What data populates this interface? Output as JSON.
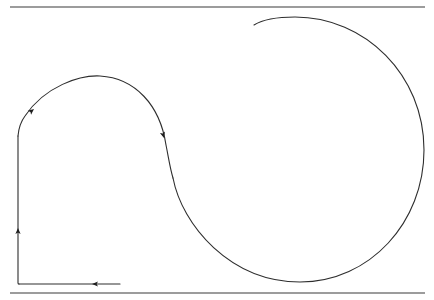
{
  "figure": {
    "type": "path-diagram",
    "colors": {
      "background": "#ffffff",
      "line": "#2e2e2e",
      "rule": "#3a3a3a"
    },
    "rules": [
      {
        "name": "top-rule",
        "x1": 10,
        "y1": 7,
        "x2": 425,
        "y2": 7
      },
      {
        "name": "bottom-rule",
        "x1": 10,
        "y1": 293,
        "x2": 425,
        "y2": 293
      }
    ],
    "path": {
      "segments": [
        {
          "name": "horizontal-leg",
          "direction": "left",
          "d": "M120,284 L19,284"
        },
        {
          "name": "vertical-leg",
          "direction": "up",
          "d": "M19,284 Q18,284 18,283 L18,136"
        },
        {
          "name": "top-arc",
          "direction": "clockwise",
          "d": "M18,136 Q19,124 25,116 C45,86 80,75 100,76 C135,78 160,105 166,145 C169,160 170,168 173,178"
        },
        {
          "name": "big-loop",
          "direction": "clockwise",
          "d": "M173,178 C182,225 230,282 300,282 C370,282 424,222 424,150 C424,75 365,17 295,17 C275,17 262,20 254,25"
        }
      ],
      "arrows": [
        {
          "name": "arrow-horizontal-left",
          "x": 92,
          "y": 284,
          "angle": 180
        },
        {
          "name": "arrow-vertical-up",
          "x": 18,
          "y": 228,
          "angle": -90
        },
        {
          "name": "arrow-arc-upper-left",
          "x": 34,
          "y": 109,
          "angle": -40
        },
        {
          "name": "arrow-arc-descending",
          "x": 164,
          "y": 138,
          "angle": 75
        }
      ]
    }
  }
}
